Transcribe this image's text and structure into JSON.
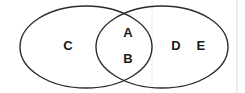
{
  "figure": {
    "type": "venn-diagram",
    "width": 245,
    "height": 93,
    "background_color": "#ffffff",
    "stroke_color": "#2b2b2b",
    "label_color": "#1a1a1a",
    "artifact_color": "#d8d8dc"
  },
  "sets": {
    "left": {
      "name": "left-set",
      "cx": 86,
      "cy": 47,
      "rx": 66,
      "ry": 41
    },
    "right": {
      "name": "right-set",
      "cx": 162,
      "cy": 47,
      "rx": 66,
      "ry": 41
    }
  },
  "regions": [
    {
      "region": "left-only",
      "labels": [
        {
          "text": "C",
          "x": 68,
          "y": 47
        }
      ]
    },
    {
      "region": "intersection",
      "labels": [
        {
          "text": "A",
          "x": 128,
          "y": 34
        },
        {
          "text": "B",
          "x": 128,
          "y": 60
        }
      ]
    },
    {
      "region": "right-only",
      "labels": [
        {
          "text": "D",
          "x": 176,
          "y": 47
        },
        {
          "text": "E",
          "x": 201,
          "y": 47
        }
      ]
    }
  ],
  "labels_flat": {
    "c": "C",
    "a": "A",
    "b": "B",
    "d": "D",
    "e": "E"
  },
  "artifacts": {
    "right_edge_line_x": 237,
    "mid_faint_line_x": 152
  }
}
